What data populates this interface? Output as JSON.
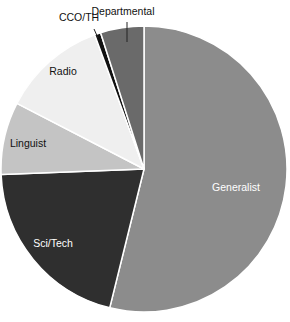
{
  "chart_data": {
    "type": "pie",
    "title": "",
    "start_angle_deg": 0,
    "direction": "clockwise",
    "unit": "percent (estimated from slice angles)",
    "legend": "none (labels placed on/near slices)",
    "slices": [
      {
        "label": "Generalist",
        "value": 53.8,
        "color": "#8c8c8c",
        "label_color": "#ffffff",
        "label_pos": "inside"
      },
      {
        "label": "Sci/Tech",
        "value": 20.5,
        "color": "#2f2f2f",
        "label_color": "#ffffff",
        "label_pos": "inside"
      },
      {
        "label": "Linguist",
        "value": 8.2,
        "color": "#c4c4c4",
        "label_color": "#111111",
        "label_pos": "inside"
      },
      {
        "label": "Radio",
        "value": 11.8,
        "color": "#efefef",
        "label_color": "#111111",
        "label_pos": "inside"
      },
      {
        "label": "CCO/TH",
        "value": 0.7,
        "color": "#111111",
        "label_color": "#111111",
        "label_pos": "outside"
      },
      {
        "label": "Departmental",
        "value": 4.9,
        "color": "#6a6a6a",
        "label_color": "#111111",
        "label_pos": "outside"
      }
    ]
  },
  "labels": {
    "generalist": "Generalist",
    "scitech": "Sci/Tech",
    "linguist": "Linguist",
    "radio": "Radio",
    "ccoth": "CCO/TH",
    "departmental": "Departmental"
  }
}
